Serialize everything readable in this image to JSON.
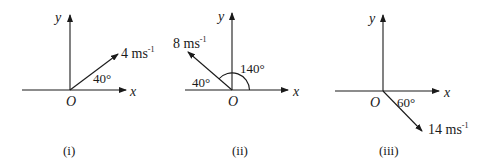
{
  "diagrams": [
    {
      "id": "i",
      "caption": "(i)",
      "origin_label": "O",
      "x_label": "x",
      "y_label": "y",
      "vector": {
        "magnitude": "4",
        "unit": "ms",
        "exponent": "-1",
        "angle_deg": 40,
        "direction": "up-right"
      },
      "angle_labels": [
        "40°"
      ]
    },
    {
      "id": "ii",
      "caption": "(ii)",
      "origin_label": "O",
      "x_label": "x",
      "y_label": "y",
      "vector": {
        "magnitude": "8",
        "unit": "ms",
        "exponent": "-1",
        "angle_deg": 140,
        "direction": "up-left"
      },
      "angle_labels": [
        "40°",
        "140°"
      ]
    },
    {
      "id": "iii",
      "caption": "(iii)",
      "origin_label": "O",
      "x_label": "x",
      "y_label": "y",
      "vector": {
        "magnitude": "14",
        "unit": "ms",
        "exponent": "-1",
        "angle_deg": -60,
        "direction": "down-right"
      },
      "angle_labels": [
        "60°"
      ]
    }
  ],
  "colors": {
    "ink": "#1a1a1a",
    "background": "#ffffff"
  }
}
